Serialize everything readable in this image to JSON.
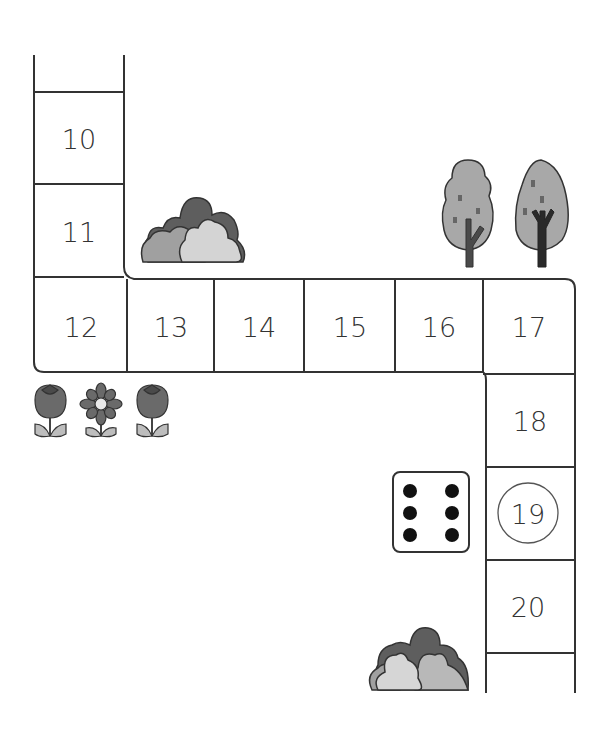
{
  "board": {
    "title": "Number path board game",
    "cells": [
      {
        "number": "10",
        "highlighted": false
      },
      {
        "number": "11",
        "highlighted": false
      },
      {
        "number": "12",
        "highlighted": false
      },
      {
        "number": "13",
        "highlighted": false
      },
      {
        "number": "14",
        "highlighted": false
      },
      {
        "number": "15",
        "highlighted": false
      },
      {
        "number": "16",
        "highlighted": false
      },
      {
        "number": "17",
        "highlighted": false
      },
      {
        "number": "18",
        "highlighted": false
      },
      {
        "number": "19",
        "highlighted": true
      },
      {
        "number": "20",
        "highlighted": false
      }
    ],
    "die": {
      "face_value": 6
    },
    "decorations": [
      "bush",
      "tree",
      "tree",
      "tulip",
      "daisy",
      "tulip",
      "bush"
    ]
  },
  "colors": {
    "line": "#333333",
    "dark_gray": "#5e5e5e",
    "mid_gray": "#9a9a9a",
    "light_gray": "#cfcfcf",
    "tree_crown": "#a8a8a8",
    "trunk": "#4a4a4a"
  }
}
